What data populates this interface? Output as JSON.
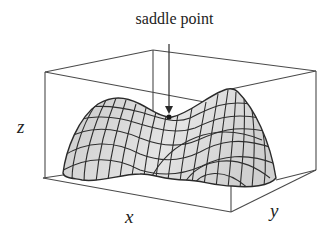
{
  "figure": {
    "annotation": "saddle point",
    "axes": {
      "x": "x",
      "y": "y",
      "z": "z"
    },
    "colors": {
      "line": "#2a2a2a",
      "surface": "#d9d9d9",
      "box": "#4a4a4a"
    }
  }
}
